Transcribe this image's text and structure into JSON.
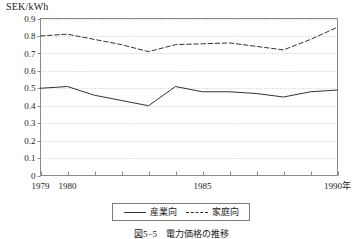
{
  "figure": {
    "unit_label": "SEK/kWh",
    "caption": "図5−5　電力価格の推移"
  },
  "legend": {
    "entries": [
      {
        "label": "産業向",
        "style": "solid",
        "color": "#333333"
      },
      {
        "label": "家庭向",
        "style": "dashed",
        "color": "#333333"
      }
    ]
  },
  "chart_data": {
    "type": "line",
    "title": "",
    "xlabel": "",
    "ylabel": "SEK/kWh",
    "x": [
      1979,
      1980,
      1981,
      1982,
      1983,
      1984,
      1985,
      1986,
      1987,
      1988,
      1989,
      1990
    ],
    "xtick_labels": [
      "1979",
      "1980",
      "",
      "",
      "",
      "",
      "1985",
      "",
      "",
      "",
      "",
      "1990年"
    ],
    "ytick_labels": [
      "0",
      "0.1",
      "0.2",
      "0.3",
      "0.4",
      "0.5",
      "0.6",
      "0.7",
      "0.8",
      "0.9"
    ],
    "ytick_values": [
      0,
      0.1,
      0.2,
      0.3,
      0.4,
      0.5,
      0.6,
      0.7,
      0.8,
      0.9
    ],
    "xlim": [
      1979,
      1990
    ],
    "ylim": [
      0,
      0.9
    ],
    "grid": true,
    "legend_position": "below",
    "series": [
      {
        "name": "産業向",
        "style": "solid",
        "color": "#333333",
        "values": [
          0.5,
          0.51,
          0.46,
          0.43,
          0.4,
          0.51,
          0.48,
          0.48,
          0.47,
          0.45,
          0.48,
          0.49
        ]
      },
      {
        "name": "家庭向",
        "style": "dashed",
        "color": "#333333",
        "values": [
          0.8,
          0.81,
          0.78,
          0.75,
          0.71,
          0.75,
          0.755,
          0.76,
          0.74,
          0.72,
          0.78,
          0.85
        ]
      }
    ]
  }
}
